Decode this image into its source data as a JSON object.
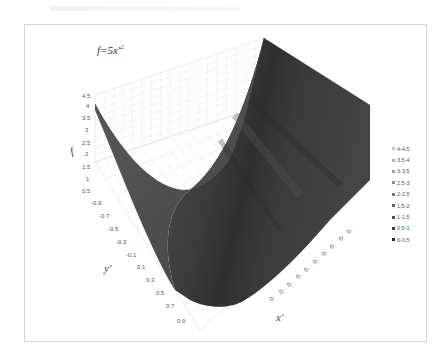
{
  "chart_data": {
    "type": "surface",
    "title_base": "f=5x'",
    "title_exp": "2",
    "xlabel": "x'",
    "ylabel": "y'",
    "zlabel": "f",
    "z_ticks": [
      "4.5",
      "4",
      "3.5",
      "3",
      "2.5",
      "2",
      "1.5",
      "1",
      "0.5",
      "0"
    ],
    "y_ticks": [
      "-0.9",
      "-0.7",
      "-0.5",
      "-0.3",
      "-0.1",
      "0.1",
      "0.3",
      "0.5",
      "0.7",
      "0.9"
    ],
    "x_ticks": [
      "0",
      "0.",
      "0.",
      "0.",
      "0.",
      "0.",
      "0.",
      "0.",
      "0.",
      "0."
    ],
    "zlim": [
      0,
      4.5
    ],
    "surface_formula": "f = 5 * x'^2",
    "x_range": [
      -0.9,
      0.9
    ],
    "y_range": [
      -0.9,
      0.9
    ],
    "grid": true,
    "legend": {
      "position": "right",
      "entries": [
        "4-4.5",
        "3.5-4",
        "3-3.5",
        "2.5-3",
        "2-2.5",
        "1.5-2",
        "1-1.5",
        "0.5-1",
        "0-0.5"
      ],
      "colors": [
        "#c8c8c8",
        "#b4b4b4",
        "#a0a0a0",
        "#8c8c8c",
        "#787878",
        "#646464",
        "#505050",
        "#3c3c3c",
        "#282828"
      ]
    },
    "samples": [
      {
        "x": -0.9,
        "f": 4.05
      },
      {
        "x": -0.6,
        "f": 1.8
      },
      {
        "x": -0.3,
        "f": 0.45
      },
      {
        "x": 0.0,
        "f": 0.0
      },
      {
        "x": 0.3,
        "f": 0.45
      },
      {
        "x": 0.6,
        "f": 1.8
      },
      {
        "x": 0.9,
        "f": 4.05
      }
    ]
  }
}
